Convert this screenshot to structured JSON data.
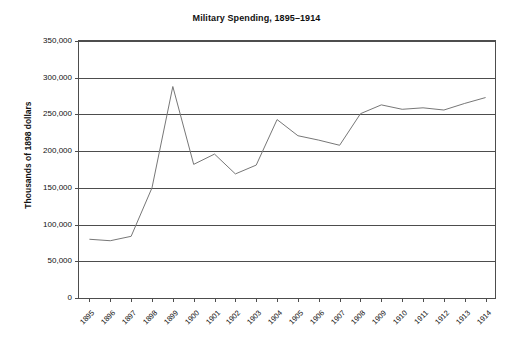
{
  "chart_data": {
    "type": "line",
    "title": "Military Spending, 1895–1914",
    "xlabel": "",
    "ylabel": "Thousands of 1898 dollars",
    "ylim": [
      0,
      350000
    ],
    "ytick_values": [
      0,
      50000,
      100000,
      150000,
      200000,
      250000,
      300000,
      350000
    ],
    "ytick_labels": [
      "0",
      "50,000",
      "100,000",
      "150,000",
      "200,000",
      "250,000",
      "300,000",
      "350,000"
    ],
    "grid": true,
    "legend": null,
    "line_color": "#777777",
    "axis_color": "#4d4d4d",
    "categories": [
      "1895",
      "1896",
      "1897",
      "1898",
      "1899",
      "1900",
      "1901",
      "1902",
      "1903",
      "1904",
      "1905",
      "1906",
      "1907",
      "1908",
      "1909",
      "1910",
      "1911",
      "1912",
      "1913",
      "1914"
    ],
    "values": [
      80000,
      78000,
      84000,
      150000,
      288000,
      182000,
      196000,
      169000,
      181000,
      243000,
      221000,
      215000,
      208000,
      251000,
      263000,
      257000,
      259000,
      256000,
      265000,
      273000
    ],
    "series": [
      {
        "name": "Military Spending",
        "values": [
          80000,
          78000,
          84000,
          150000,
          288000,
          182000,
          196000,
          169000,
          181000,
          243000,
          221000,
          215000,
          208000,
          251000,
          263000,
          257000,
          259000,
          256000,
          265000,
          273000
        ]
      }
    ]
  }
}
